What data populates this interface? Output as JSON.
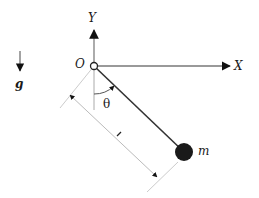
{
  "diagram": {
    "labels": {
      "gravity": "g",
      "origin": "O",
      "x_axis": "X",
      "y_axis": "Y",
      "angle": "θ",
      "length": "l",
      "mass": "m"
    },
    "colors": {
      "axis": "#555555",
      "rod": "#333333",
      "mass": "#1a1a1a",
      "dimension": "#bbbbbb",
      "arrowhead": "#111111"
    },
    "geometry": {
      "pivot": [
        94,
        66
      ],
      "mass_center": [
        184,
        152
      ],
      "mass_radius": 9
    }
  }
}
